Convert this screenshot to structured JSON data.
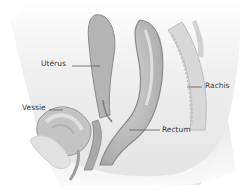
{
  "diagram": {
    "type": "anatomical sagittal section",
    "labels": [
      {
        "id": "uterus",
        "text": "Utérus"
      },
      {
        "id": "vessie",
        "text": "Vessie"
      },
      {
        "id": "rachis",
        "text": "Rachis"
      },
      {
        "id": "rectum",
        "text": "Rectum"
      }
    ],
    "colors": {
      "background": "#ffffff",
      "tissue_light": "#ececec",
      "organ_mid": "#c8c8c8",
      "organ_dark": "#9a9a9a",
      "leader_line": "#4a4a4a",
      "label_text": "#3a3a3a"
    }
  }
}
